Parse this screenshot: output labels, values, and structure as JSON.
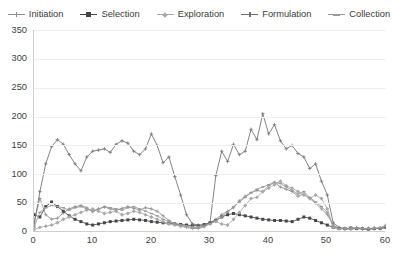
{
  "chart_data": {
    "type": "line",
    "title": "",
    "xlabel": "",
    "ylabel": "",
    "xlim": [
      0,
      60
    ],
    "ylim": [
      0,
      350
    ],
    "yticks": [
      0,
      50,
      100,
      150,
      200,
      250,
      300,
      350
    ],
    "xticks": [
      0,
      10,
      20,
      30,
      40,
      50,
      60
    ],
    "grid": true,
    "legend_position": "top",
    "x": [
      0,
      1,
      2,
      3,
      4,
      5,
      6,
      7,
      8,
      9,
      10,
      11,
      12,
      13,
      14,
      15,
      16,
      17,
      18,
      19,
      20,
      21,
      22,
      23,
      24,
      25,
      26,
      27,
      28,
      29,
      30,
      31,
      32,
      33,
      34,
      35,
      36,
      37,
      38,
      39,
      40,
      41,
      42,
      43,
      44,
      45,
      46,
      47,
      48,
      49,
      50,
      51,
      52,
      53,
      54,
      55,
      56,
      57,
      58,
      59,
      60
    ],
    "series": [
      {
        "name": "Initiation",
        "color": "#8c8c8c",
        "marker": "plus",
        "values": [
          18,
          58,
          30,
          22,
          24,
          33,
          40,
          44,
          46,
          42,
          35,
          40,
          43,
          40,
          38,
          41,
          44,
          41,
          38,
          42,
          40,
          36,
          28,
          20,
          14,
          10,
          8,
          6,
          6,
          9,
          16,
          22,
          30,
          36,
          42,
          54,
          62,
          68,
          72,
          70,
          80,
          86,
          78,
          74,
          70,
          62,
          66,
          58,
          50,
          40,
          30,
          12,
          6,
          5,
          5,
          6,
          5,
          5,
          6,
          7,
          12
        ]
      },
      {
        "name": "Selection",
        "color": "#464646",
        "marker": "square",
        "values": [
          30,
          26,
          44,
          52,
          44,
          36,
          28,
          22,
          18,
          14,
          12,
          14,
          16,
          18,
          19,
          20,
          21,
          22,
          21,
          20,
          18,
          17,
          16,
          15,
          14,
          13,
          12,
          11,
          11,
          13,
          16,
          20,
          26,
          30,
          32,
          30,
          28,
          26,
          24,
          22,
          21,
          20,
          20,
          19,
          18,
          22,
          26,
          24,
          20,
          16,
          12,
          8,
          6,
          6,
          7,
          6,
          6,
          5,
          6,
          6,
          8
        ]
      },
      {
        "name": "Exploration",
        "color": "#a8a8a8",
        "marker": "diamond",
        "values": [
          4,
          8,
          10,
          12,
          16,
          22,
          26,
          30,
          34,
          38,
          40,
          36,
          32,
          34,
          36,
          30,
          32,
          36,
          34,
          30,
          26,
          22,
          18,
          14,
          12,
          10,
          9,
          8,
          8,
          10,
          14,
          18,
          14,
          12,
          22,
          34,
          46,
          58,
          60,
          70,
          76,
          82,
          88,
          80,
          76,
          70,
          64,
          58,
          64,
          58,
          40,
          8,
          6,
          6,
          6,
          7,
          6,
          6,
          7,
          7,
          9
        ]
      },
      {
        "name": "Formulation",
        "color": "#6e6e6e",
        "marker": "plus",
        "values": [
          10,
          70,
          118,
          148,
          160,
          152,
          134,
          118,
          106,
          130,
          140,
          142,
          144,
          138,
          152,
          158,
          154,
          140,
          134,
          144,
          170,
          150,
          120,
          130,
          96,
          64,
          30,
          14,
          12,
          12,
          16,
          98,
          140,
          122,
          152,
          134,
          140,
          178,
          160,
          205,
          170,
          186,
          158,
          144,
          150,
          136,
          130,
          110,
          118,
          88,
          64,
          16,
          8,
          6,
          6,
          7,
          6,
          6,
          6,
          6,
          8
        ]
      },
      {
        "name": "Collection",
        "color": "#9a9a9a",
        "marker": "dash",
        "values": [
          8,
          34,
          42,
          46,
          44,
          42,
          38,
          42,
          44,
          40,
          36,
          40,
          44,
          42,
          40,
          38,
          42,
          44,
          40,
          36,
          32,
          28,
          22,
          18,
          14,
          12,
          10,
          8,
          8,
          10,
          14,
          20,
          26,
          34,
          44,
          52,
          60,
          68,
          74,
          78,
          82,
          86,
          84,
          78,
          72,
          66,
          70,
          60,
          52,
          44,
          34,
          10,
          6,
          6,
          6,
          7,
          6,
          6,
          6,
          7,
          10
        ]
      }
    ]
  },
  "legend": {
    "items": [
      {
        "label": "Initiation"
      },
      {
        "label": "Selection"
      },
      {
        "label": "Exploration"
      },
      {
        "label": "Formulation"
      },
      {
        "label": "Collection"
      }
    ]
  },
  "axes": {
    "y": {
      "labels": [
        "350",
        "300",
        "250",
        "200",
        "150",
        "100",
        "50",
        "0"
      ]
    },
    "x": {
      "labels": [
        "0",
        "10",
        "20",
        "30",
        "40",
        "50",
        "60"
      ]
    }
  }
}
